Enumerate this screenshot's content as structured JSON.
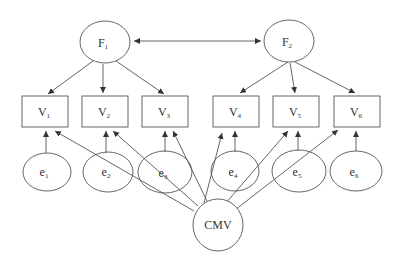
{
  "diagram": {
    "type": "structural-equation-model",
    "factors": [
      {
        "id": "F1",
        "base": "F",
        "sub": "1"
      },
      {
        "id": "F2",
        "base": "F",
        "sub": "2"
      }
    ],
    "indicators": [
      {
        "id": "V1",
        "base": "V",
        "sub": "1"
      },
      {
        "id": "V2",
        "base": "V",
        "sub": "2"
      },
      {
        "id": "V3",
        "base": "V",
        "sub": "3"
      },
      {
        "id": "V4",
        "base": "V",
        "sub": "4"
      },
      {
        "id": "V5",
        "base": "V",
        "sub": "5"
      },
      {
        "id": "V6",
        "base": "V",
        "sub": "6"
      }
    ],
    "errors": [
      {
        "id": "e1",
        "base": "e",
        "sub": "1"
      },
      {
        "id": "e2",
        "base": "e",
        "sub": "2"
      },
      {
        "id": "e3",
        "base": "e",
        "sub": "3"
      },
      {
        "id": "e4",
        "base": "e",
        "sub": "4"
      },
      {
        "id": "e5",
        "base": "e",
        "sub": "5"
      },
      {
        "id": "e6",
        "base": "e",
        "sub": "6"
      }
    ],
    "method_factor": {
      "id": "CMV",
      "label": "CMV"
    },
    "edges": [
      {
        "from": "F1",
        "to": "F2",
        "type": "covariance"
      },
      {
        "from": "F1",
        "to": "V1"
      },
      {
        "from": "F1",
        "to": "V2"
      },
      {
        "from": "F1",
        "to": "V3"
      },
      {
        "from": "F2",
        "to": "V4"
      },
      {
        "from": "F2",
        "to": "V5"
      },
      {
        "from": "F2",
        "to": "V6"
      },
      {
        "from": "e1",
        "to": "V1"
      },
      {
        "from": "e2",
        "to": "V2"
      },
      {
        "from": "e3",
        "to": "V3"
      },
      {
        "from": "e4",
        "to": "V4"
      },
      {
        "from": "e5",
        "to": "V5"
      },
      {
        "from": "e6",
        "to": "V6"
      },
      {
        "from": "CMV",
        "to": "V1"
      },
      {
        "from": "CMV",
        "to": "V2"
      },
      {
        "from": "CMV",
        "to": "V3"
      },
      {
        "from": "CMV",
        "to": "V4"
      },
      {
        "from": "CMV",
        "to": "V5"
      },
      {
        "from": "CMV",
        "to": "V6"
      }
    ],
    "colors": {
      "stroke": "#555555",
      "text": "#333333",
      "background": "#ffffff"
    }
  }
}
